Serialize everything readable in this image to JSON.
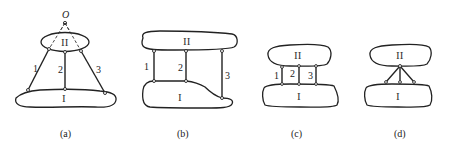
{
  "figure": {
    "panels": [
      {
        "id": "a",
        "caption": "(a)",
        "upper_body": "II",
        "lower_body": "I",
        "links": [
          "1",
          "2",
          "3"
        ],
        "point_label": "O",
        "description": "Three inclined links whose lines meet at point O"
      },
      {
        "id": "b",
        "caption": "(b)",
        "upper_body": "II",
        "lower_body": "I",
        "links": [
          "1",
          "2",
          "3"
        ],
        "description": "Three parallel vertical links of unequal length"
      },
      {
        "id": "c",
        "caption": "(c)",
        "upper_body": "II",
        "lower_body": "I",
        "links": [
          "1",
          "2",
          "3"
        ],
        "description": "Three short parallel vertical links of equal length"
      },
      {
        "id": "d",
        "caption": "(d)",
        "upper_body": "II",
        "lower_body": "I",
        "links": [],
        "description": "Three links converging at a single point on body II"
      }
    ]
  }
}
